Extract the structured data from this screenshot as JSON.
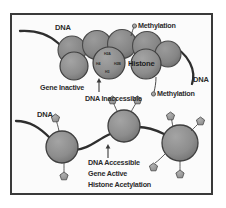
{
  "figure": {
    "frame_color": "#3a3a3a",
    "background": "#fbfbfb"
  },
  "palette": {
    "nucleosome_fill": "#8d8d8d",
    "nucleosome_stroke": "#3f3f3f",
    "dna_stroke": "#2e2e2e",
    "mark_fill": "#9a9a9a",
    "mark_stroke": "#4a4a4a",
    "text": "#2b2b2b"
  },
  "top_panel": {
    "dna_left_label": "DNA",
    "dna_right_label": "DNA",
    "methylation_top_label": "Methylation",
    "methylation_bottom_label": "Methylation",
    "histone_label": "Histone",
    "gene_state_label": "Gene Inactive",
    "dna_state_label": "DNA Inaccessible",
    "histone_subunits": [
      {
        "name": "H2A"
      },
      {
        "name": "H4"
      },
      {
        "name": "H2B"
      },
      {
        "name": "H3"
      }
    ],
    "methylation_marks_count": 2,
    "nucleosome_count": 8
  },
  "bottom_panel": {
    "dna_left_label": "DNA",
    "dna_state_label": "DNA Accessible",
    "gene_state_label": "Gene Active",
    "acetylation_label": "Histone Acetylation",
    "acetyl_marks_count": 8,
    "nucleosome_count": 3
  },
  "icons": {
    "methylation": "methyl-dot-icon",
    "acetylation": "acetyl-pentagon-icon",
    "arrow_up": "arrow-up-icon"
  }
}
